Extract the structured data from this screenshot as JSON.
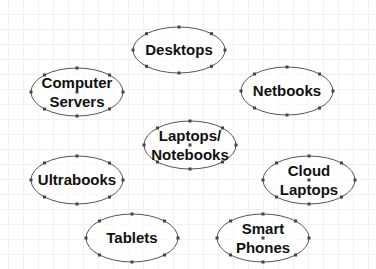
{
  "diagram": {
    "type": "unconnected-ellipse-shapes",
    "colors": {
      "background": "#ffffff",
      "grid": "#f1f1f1",
      "ellipse_stroke": "#555555",
      "handle": "#444444",
      "text": "#111111"
    },
    "nodes": [
      {
        "id": "desktops",
        "lines": [
          "Desktops"
        ],
        "cx": 179,
        "cy": 50,
        "rx": 46,
        "ry": 23,
        "center_marker": false
      },
      {
        "id": "computer-servers",
        "lines": [
          "Computer",
          "Servers"
        ],
        "cx": 77,
        "cy": 92,
        "rx": 46,
        "ry": 24,
        "center_marker": true
      },
      {
        "id": "netbooks",
        "lines": [
          "Netbooks"
        ],
        "cx": 287,
        "cy": 91,
        "rx": 46,
        "ry": 24,
        "center_marker": false
      },
      {
        "id": "laptops-notebooks",
        "lines": [
          "Laptops/",
          "Notebooks"
        ],
        "cx": 190,
        "cy": 145,
        "rx": 46,
        "ry": 24,
        "center_marker": true
      },
      {
        "id": "ultrabooks",
        "lines": [
          "Ultrabooks"
        ],
        "cx": 77,
        "cy": 180,
        "rx": 46,
        "ry": 24,
        "center_marker": false
      },
      {
        "id": "cloud-laptops",
        "lines": [
          "Cloud",
          "Laptops"
        ],
        "cx": 309,
        "cy": 180,
        "rx": 46,
        "ry": 24,
        "center_marker": true
      },
      {
        "id": "tablets",
        "lines": [
          "Tablets"
        ],
        "cx": 132,
        "cy": 238,
        "rx": 46,
        "ry": 24,
        "center_marker": false
      },
      {
        "id": "smart-phones",
        "lines": [
          "Smart",
          "Phones"
        ],
        "cx": 263,
        "cy": 238,
        "rx": 46,
        "ry": 24,
        "center_marker": true
      }
    ]
  }
}
